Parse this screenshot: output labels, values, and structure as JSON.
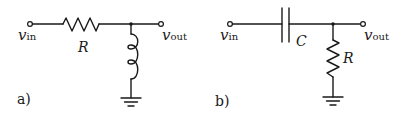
{
  "figure": {
    "circuits": [
      {
        "id": "a",
        "panel_label": "a)",
        "type": "RL high-pass filter",
        "input_label": {
          "var": "v",
          "sub": "in"
        },
        "output_label": {
          "var": "v",
          "sub": "out"
        },
        "series_component": {
          "kind": "resistor",
          "label": "R"
        },
        "shunt_component": {
          "kind": "inductor",
          "label": ""
        },
        "ground": true
      },
      {
        "id": "b",
        "panel_label": "b)",
        "type": "RC high-pass filter",
        "input_label": {
          "var": "v",
          "sub": "in"
        },
        "output_label": {
          "var": "v",
          "sub": "out"
        },
        "series_component": {
          "kind": "capacitor",
          "label": "C"
        },
        "shunt_component": {
          "kind": "resistor",
          "label": "R"
        },
        "ground": true
      }
    ],
    "colors": {
      "ink": "#1a1a1a",
      "background": "#ffffff"
    }
  }
}
